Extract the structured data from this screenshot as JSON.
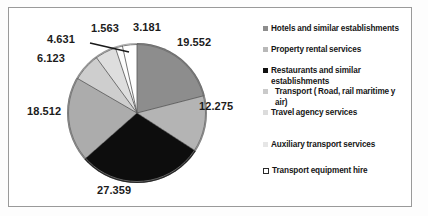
{
  "chart_data": {
    "type": "pie",
    "title": "",
    "subtitle": "",
    "xlabel": "",
    "ylabel": "",
    "grid": false,
    "legend_position": "right",
    "total": 93.236,
    "categories": [
      "Hotels and similar establishments",
      "Property rental services",
      "Restaurants and similar establishments",
      "Transport ( Road, rail maritime y air)",
      "Travel agency services",
      "Auxiliary transport services",
      "Transport equipment hire"
    ],
    "values": [
      19.552,
      12.275,
      27.359,
      18.512,
      6.123,
      4.631,
      1.563
    ],
    "labels": [
      "19.552",
      "12.275",
      "27.359",
      "18.512",
      "6.123",
      "4.631",
      "1.563",
      "3.181"
    ],
    "slices": [
      {
        "label": "19.552",
        "value": 19.552,
        "category": "Hotels and similar establishments",
        "color": "#8d8d8d"
      },
      {
        "label": "12.275",
        "value": 12.275,
        "category": "Property rental services",
        "color": "#b4b4b4"
      },
      {
        "label": "27.359",
        "value": 27.359,
        "category": "Restaurants and similar establishments",
        "color": "#0d0d0d"
      },
      {
        "label": "18.512",
        "value": 18.512,
        "category": "Transport ( Road, rail maritime y air)",
        "color": "#acacac"
      },
      {
        "label": "6.123",
        "value": 6.123,
        "category": "Travel agency services",
        "color": "#cecece"
      },
      {
        "label": "4.631",
        "value": 4.631,
        "category": "Auxiliary transport services",
        "color": "#dedede"
      },
      {
        "label": "1.563",
        "value": 1.563,
        "category": "Transport equipment hire",
        "color": "#fcfcfc"
      },
      {
        "label": "3.181",
        "value": 3.181,
        "category": "",
        "color": "#ffffff"
      }
    ]
  },
  "legend": {
    "items": [
      {
        "label": "Hotels and similar establishments",
        "swatch": "#8d8d8d",
        "style": "solid"
      },
      {
        "label": "Property rental services",
        "swatch": "#b8b8b8",
        "style": "solid"
      },
      {
        "label": "Restaurants and similar establishments",
        "swatch": "#111111",
        "style": "solid"
      },
      {
        "label": "Transport ( Road, rail maritime y air)",
        "swatch": "#cacaca",
        "style": "solid"
      },
      {
        "label": "Travel agency services",
        "swatch": "#dcdcdc",
        "style": "solid"
      },
      {
        "label": "Auxiliary transport services",
        "swatch": "#e6e6e6",
        "style": "solid"
      },
      {
        "label": "Transport equipment hire",
        "swatch": "#ffffff",
        "style": "outlined"
      }
    ]
  },
  "data_labels": {
    "l19": "19.552",
    "l12": "12.275",
    "l27": "27.359",
    "l18": "18.512",
    "l6": "6.123",
    "l4": "4.631",
    "l1": "1.563",
    "l3": "3.181"
  },
  "colors": {
    "frame_border": "#9a9a9a",
    "background": "#ffffff",
    "text": "#161616"
  }
}
